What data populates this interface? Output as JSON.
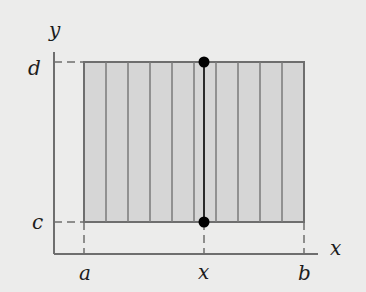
{
  "diagram": {
    "type": "region-of-integration",
    "axes": {
      "x_label": "x",
      "y_label": "y"
    },
    "tick_labels": {
      "x": [
        "a",
        "x",
        "b"
      ],
      "y": [
        "c",
        "d"
      ]
    },
    "labels": {
      "y_axis": "y",
      "x_axis": "x",
      "d": "d",
      "c": "c",
      "a": "a",
      "x_tick": "x",
      "b": "b"
    },
    "points": [
      {
        "name": "top-point",
        "at": "(x, d)"
      },
      {
        "name": "bottom-point",
        "at": "(x, c)"
      }
    ],
    "strip_count": 10,
    "colors": {
      "background": "#ececeb",
      "rect_fill": "#d6d6d6",
      "line": "#6e6e6e",
      "point": "#000000"
    }
  }
}
